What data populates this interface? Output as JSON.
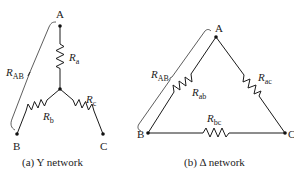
{
  "figure": {
    "y_network": {
      "caption": "(a) Y network",
      "nodes": {
        "a": "A",
        "b": "B",
        "c": "C"
      },
      "resistors": [
        {
          "id": "Ra",
          "main": "R",
          "sub": "a"
        },
        {
          "id": "Rb",
          "main": "R",
          "sub": "b"
        },
        {
          "id": "Rc",
          "main": "R",
          "sub": "c"
        }
      ],
      "measure_label": {
        "main": "R",
        "sub": "AB"
      }
    },
    "delta_network": {
      "caption": "(b) Δ network",
      "nodes": {
        "a": "A",
        "b": "B",
        "c": "C"
      },
      "resistors": [
        {
          "id": "Rab",
          "main": "R",
          "sub": "ab"
        },
        {
          "id": "Rac",
          "main": "R",
          "sub": "ac"
        },
        {
          "id": "Rbc",
          "main": "R",
          "sub": "bc"
        }
      ],
      "measure_label": {
        "main": "R",
        "sub": "AB"
      }
    }
  }
}
